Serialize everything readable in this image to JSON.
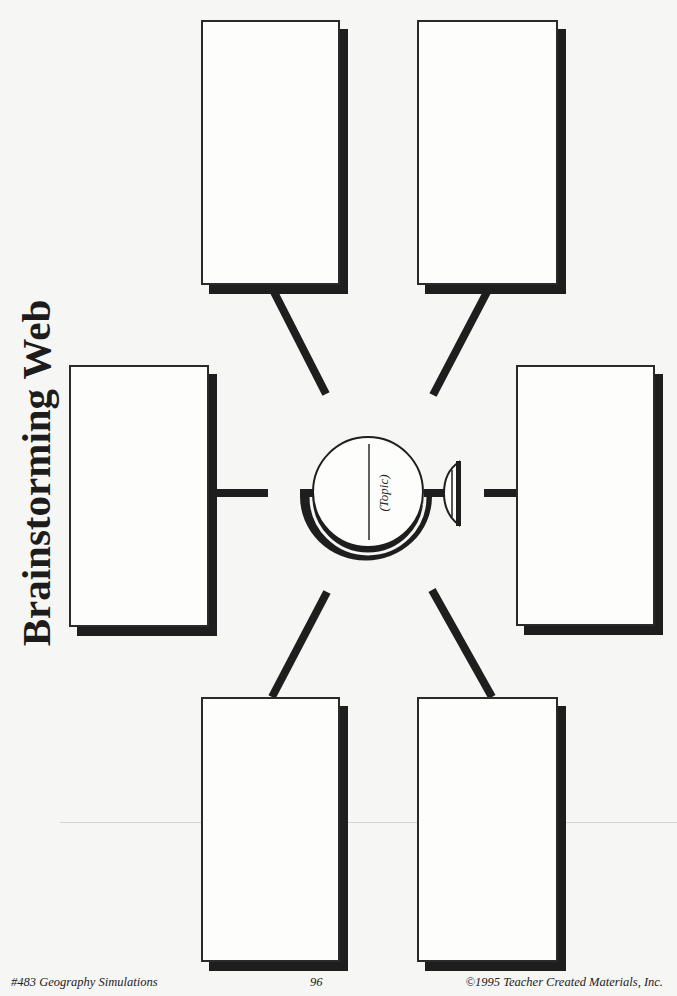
{
  "page": {
    "title": "Brainstorming Web",
    "topic_label": "(Topic)"
  },
  "boxes": [
    {
      "id": "top-left",
      "label": ""
    },
    {
      "id": "top-right",
      "label": ""
    },
    {
      "id": "middle-left",
      "label": ""
    },
    {
      "id": "middle-right",
      "label": ""
    },
    {
      "id": "bottom-left",
      "label": ""
    },
    {
      "id": "bottom-right",
      "label": ""
    }
  ],
  "icons": {
    "center": "globe-icon"
  },
  "footer": {
    "book": "#483 Geography Simulations",
    "page_number": "96",
    "copyright": "©1995 Teacher Created Materials, Inc."
  },
  "colors": {
    "ink": "#1e1e1e",
    "paper": "#f6f6f4"
  }
}
